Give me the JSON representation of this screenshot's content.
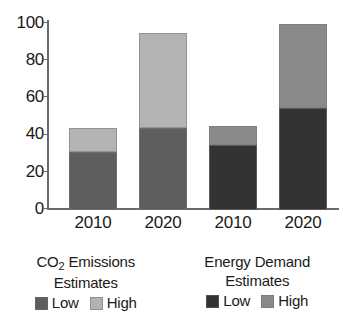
{
  "chart_data": {
    "type": "bar",
    "subtype": "stacked-bar",
    "title": "",
    "xlabel": "",
    "ylabel": "",
    "ylim": [
      0,
      100
    ],
    "yticks": [
      0,
      20,
      40,
      60,
      80,
      100
    ],
    "grid": false,
    "legend_position": "bottom",
    "categories": [
      "2010",
      "2020",
      "2010",
      "2020"
    ],
    "groups": [
      {
        "name": "CO2 Emissions Estimates",
        "categories": [
          "2010",
          "2020"
        ],
        "series": [
          {
            "name": "Low",
            "values": [
              31,
              44
            ],
            "color": "#5e5e5e"
          },
          {
            "name": "High",
            "values": [
              13,
              51
            ],
            "color": "#b3b3b3"
          }
        ],
        "totals": [
          44,
          95
        ]
      },
      {
        "name": "Energy Demand Estimates",
        "categories": [
          "2010",
          "2020"
        ],
        "series": [
          {
            "name": "Low",
            "values": [
              35,
              55
            ],
            "color": "#333333"
          },
          {
            "name": "High",
            "values": [
              10,
              45
            ],
            "color": "#8a8a8a"
          }
        ],
        "totals": [
          45,
          100
        ]
      }
    ]
  },
  "axis": {
    "y_ticks": [
      {
        "label": "100",
        "value": 100
      },
      {
        "label": "80",
        "value": 80
      },
      {
        "label": "60",
        "value": 60
      },
      {
        "label": "40",
        "value": 40
      },
      {
        "label": "20",
        "value": 20
      },
      {
        "label": "0",
        "value": 0
      }
    ],
    "x_ticks": [
      {
        "label": "2010"
      },
      {
        "label": "2020"
      },
      {
        "label": "2010"
      },
      {
        "label": "2020"
      }
    ]
  },
  "legends": [
    {
      "title_main": "CO",
      "title_sub": "2",
      "title_rest": " Emissions",
      "title_line2": "Estimates",
      "keys": [
        {
          "label": "Low",
          "color": "#5e5e5e"
        },
        {
          "label": "High",
          "color": "#b3b3b3"
        }
      ]
    },
    {
      "title_main": "Energy Demand",
      "title_sub": "",
      "title_rest": "",
      "title_line2": "Estimates",
      "keys": [
        {
          "label": "Low",
          "color": "#333333"
        },
        {
          "label": "High",
          "color": "#8a8a8a"
        }
      ]
    }
  ],
  "colors": {
    "axis": "#6b6b6b",
    "text": "#1a1a1a",
    "background": "#ffffff"
  }
}
